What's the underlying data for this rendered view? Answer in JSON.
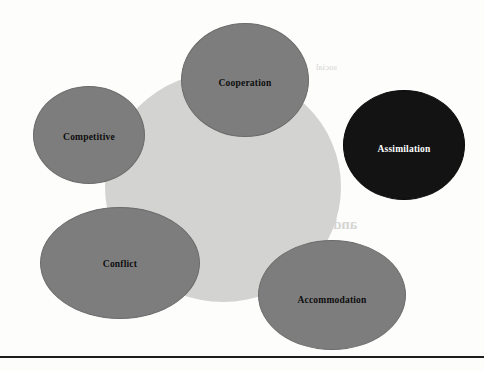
{
  "page": {
    "background_color": "#fdfdfc",
    "width": 484,
    "height": 371
  },
  "diagram": {
    "type": "overlapping-ellipse-concept-map",
    "core": {
      "label": "",
      "color": "#d3d3d1"
    },
    "nodes": [
      {
        "id": "competitive",
        "label": "Competitive",
        "fill": "#7d7d7d",
        "text_color": "#0d0d0d"
      },
      {
        "id": "cooperation",
        "label": "Cooperation",
        "fill": "#7d7d7d",
        "text_color": "#0d0d0d"
      },
      {
        "id": "assimilation",
        "label": "Assimilation",
        "fill": "#131313",
        "text_color": "#ffffff"
      },
      {
        "id": "conflict",
        "label": "Conflict",
        "fill": "#7d7d7d",
        "text_color": "#0d0d0d"
      },
      {
        "id": "accommodation",
        "label": "Accommodation",
        "fill": "#7d7d7d",
        "text_color": "#0d0d0d"
      }
    ]
  },
  "ghost_text": {
    "note": "faint show-through from the reverse side of the scanned page; largely illegible",
    "color": "#cfcfcb",
    "lines": [
      {
        "text": "and process Theory",
        "x": 232,
        "y": 216,
        "size": 15
      },
      {
        "text": "the action",
        "x": 246,
        "y": 132,
        "size": 9
      },
      {
        "text": "of the social",
        "x": 210,
        "y": 150,
        "size": 9
      },
      {
        "text": "is what the",
        "x": 206,
        "y": 168,
        "size": 9
      },
      {
        "text": "the",
        "x": 258,
        "y": 252,
        "size": 9
      },
      {
        "text": "in the",
        "x": 92,
        "y": 300,
        "size": 9
      },
      {
        "text": "social",
        "x": 316,
        "y": 62,
        "size": 9
      }
    ]
  },
  "rule": {
    "color": "#1d1d1d"
  }
}
